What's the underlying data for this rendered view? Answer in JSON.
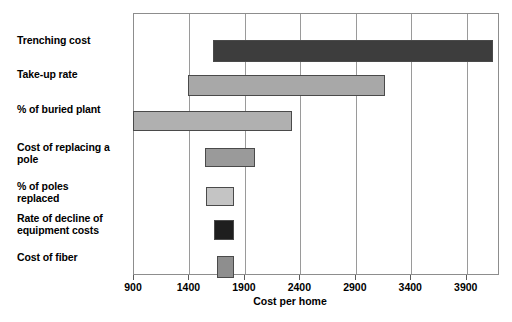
{
  "chart_data": {
    "type": "bar",
    "orientation": "horizontal",
    "title": "",
    "subtitle": "",
    "xlabel": "Cost per home",
    "ylabel": "",
    "xlim": [
      900,
      4200
    ],
    "xticks": [
      900,
      1400,
      1900,
      2400,
      2900,
      3400,
      3900
    ],
    "xtick_labels": [
      "900",
      "1400",
      "1900",
      "2400",
      "2900",
      "3400",
      "3900"
    ],
    "grid": true,
    "grid_axis": "x",
    "legend": false,
    "legend_position": "none",
    "categories": [
      "Trenching cost",
      "Take-up rate",
      "% of buried plant",
      "Cost of replacing a pole",
      "% of poles replaced",
      "Rate of decline of equipment costs",
      "Cost of fiber"
    ],
    "bars": [
      {
        "category": "Trenching cost",
        "low": 1620,
        "high": 4150,
        "color": "#3d3d3d"
      },
      {
        "category": "Take-up rate",
        "low": 1400,
        "high": 3170,
        "color": "#a8a8a8"
      },
      {
        "category": "% of buried plant",
        "low": 900,
        "high": 2330,
        "color": "#b0b0b0"
      },
      {
        "category": "Cost of replacing a pole",
        "low": 1545,
        "high": 2000,
        "color": "#9a9a9a"
      },
      {
        "category": "% of poles replaced",
        "low": 1555,
        "high": 1810,
        "color": "#c4c4c4"
      },
      {
        "category": "Rate of decline of equipment costs",
        "low": 1630,
        "high": 1810,
        "color": "#1e1e1e"
      },
      {
        "category": "Cost of fiber",
        "low": 1655,
        "high": 1810,
        "color": "#8e8e8e"
      }
    ],
    "values": [
      2530,
      1770,
      1430,
      455,
      255,
      180,
      155
    ],
    "colors": {
      "axis": "#8d8d8d",
      "grid": "#9a9a9a",
      "text": "#000000",
      "background": "#ffffff"
    }
  },
  "labels": {
    "cat_0": "Trenching cost",
    "cat_1": "Take-up rate",
    "cat_2": "% of buried plant",
    "cat_3_line1": "Cost of replacing a",
    "cat_3_line2": "pole",
    "cat_4_line1": "% of poles",
    "cat_4_line2": "replaced",
    "cat_5_line1": "Rate of decline of",
    "cat_5_line2": "equipment costs",
    "cat_6": "Cost of fiber"
  },
  "axis": {
    "title": "Cost per home",
    "tick_0": "900",
    "tick_1": "1400",
    "tick_2": "1900",
    "tick_3": "2400",
    "tick_4": "2900",
    "tick_5": "3400",
    "tick_6": "3900"
  }
}
